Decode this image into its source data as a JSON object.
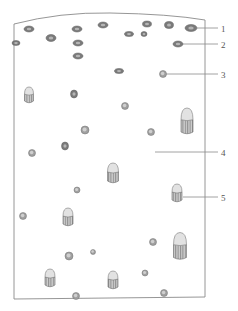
{
  "diagram": {
    "type": "scientific-illustration",
    "frame": {
      "stroke": "#8a8a8a"
    },
    "colors": {
      "line": "#8a8a8a",
      "dark_cell": "#7a7a7a",
      "dark_cell_inner": "#b5b5b5",
      "round_cell": "#a0a0a0",
      "round_cell_inner": "#cfcfcf",
      "cone_body": "#9a9a9a",
      "cone_cap": "#e2e2e2",
      "label_text": "#555555"
    },
    "labels": [
      {
        "text": "1",
        "x": 221,
        "y": 24,
        "line": [
          196,
          28,
          218,
          28
        ]
      },
      {
        "text": "2",
        "x": 221,
        "y": 40,
        "line": [
          183,
          44,
          218,
          44
        ]
      },
      {
        "text": "3",
        "x": 221,
        "y": 70,
        "line": [
          166,
          74,
          218,
          74
        ]
      },
      {
        "text": "4",
        "x": 221,
        "y": 148,
        "line": [
          155,
          152,
          218,
          152
        ]
      },
      {
        "text": "5",
        "x": 221,
        "y": 193,
        "line": [
          183,
          197,
          218,
          197
        ]
      }
    ],
    "dark_cells": [
      {
        "x": 29,
        "y": 29,
        "rx": 5,
        "ry": 3
      },
      {
        "x": 51,
        "y": 38,
        "rx": 5,
        "ry": 3.5
      },
      {
        "x": 77,
        "y": 29,
        "rx": 5,
        "ry": 3
      },
      {
        "x": 103,
        "y": 25,
        "rx": 5,
        "ry": 3
      },
      {
        "x": 147,
        "y": 24,
        "rx": 4.5,
        "ry": 3
      },
      {
        "x": 169,
        "y": 25,
        "rx": 4.5,
        "ry": 3.5
      },
      {
        "x": 191,
        "y": 28,
        "rx": 6,
        "ry": 3.5
      },
      {
        "x": 16,
        "y": 43,
        "rx": 4,
        "ry": 2.5
      },
      {
        "x": 78,
        "y": 43,
        "rx": 5,
        "ry": 3
      },
      {
        "x": 78,
        "y": 56,
        "rx": 5,
        "ry": 3
      },
      {
        "x": 129,
        "y": 34,
        "rx": 4.5,
        "ry": 2.5
      },
      {
        "x": 144,
        "y": 34,
        "rx": 3,
        "ry": 2.5
      },
      {
        "x": 178,
        "y": 44,
        "rx": 5,
        "ry": 3
      },
      {
        "x": 119,
        "y": 71,
        "rx": 4.5,
        "ry": 2.5
      },
      {
        "x": 74,
        "y": 94,
        "rx": 3.5,
        "ry": 4
      },
      {
        "x": 65,
        "y": 146,
        "rx": 3.5,
        "ry": 4
      }
    ],
    "round_cells": [
      {
        "x": 163,
        "y": 74,
        "r": 3.5
      },
      {
        "x": 125,
        "y": 106,
        "r": 3.5
      },
      {
        "x": 85,
        "y": 130,
        "r": 4
      },
      {
        "x": 151,
        "y": 132,
        "r": 3.5
      },
      {
        "x": 32,
        "y": 153,
        "r": 3.5
      },
      {
        "x": 77,
        "y": 190,
        "r": 3
      },
      {
        "x": 23,
        "y": 216,
        "r": 3.5
      },
      {
        "x": 69,
        "y": 256,
        "r": 4
      },
      {
        "x": 93,
        "y": 252,
        "r": 2.5
      },
      {
        "x": 153,
        "y": 242,
        "r": 3.5
      },
      {
        "x": 145,
        "y": 273,
        "r": 3
      },
      {
        "x": 76,
        "y": 296,
        "r": 3.5
      },
      {
        "x": 164,
        "y": 293,
        "r": 3.5
      },
      {
        "x": 186,
        "y": 129,
        "r": 0
      }
    ],
    "cone_cells": [
      {
        "x": 29,
        "y": 95,
        "w": 9,
        "h": 16
      },
      {
        "x": 187,
        "y": 121,
        "w": 12,
        "h": 26
      },
      {
        "x": 113,
        "y": 173,
        "w": 11,
        "h": 20
      },
      {
        "x": 177,
        "y": 193,
        "w": 10,
        "h": 18
      },
      {
        "x": 68,
        "y": 217,
        "w": 10,
        "h": 18
      },
      {
        "x": 180,
        "y": 246,
        "w": 13,
        "h": 27
      },
      {
        "x": 50,
        "y": 278,
        "w": 10,
        "h": 18
      },
      {
        "x": 113,
        "y": 280,
        "w": 10,
        "h": 18
      }
    ]
  }
}
